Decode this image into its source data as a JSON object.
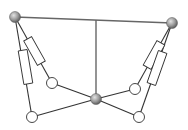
{
  "diagram": {
    "type": "parallel-mechanism-schematic",
    "colors": {
      "line": "#333333",
      "top_bar": "#666666",
      "ball_light": "#d8d8d8",
      "ball_dark": "#6e6e6e",
      "joint_fill": "#ffffff"
    },
    "nodes": [
      {
        "id": "base-left-ball",
        "kind": "spherical",
        "x": 15,
        "y": 17
      },
      {
        "id": "base-right-ball",
        "kind": "spherical",
        "x": 172,
        "y": 23
      },
      {
        "id": "platform-center-ball",
        "kind": "spherical",
        "x": 96,
        "y": 99
      },
      {
        "id": "left-inner-joint",
        "kind": "revolute",
        "x": 52,
        "y": 83
      },
      {
        "id": "left-outer-joint",
        "kind": "revolute",
        "x": 32,
        "y": 117
      },
      {
        "id": "right-inner-joint",
        "kind": "revolute",
        "x": 135,
        "y": 89
      },
      {
        "id": "right-outer-joint",
        "kind": "revolute",
        "x": 139,
        "y": 117
      }
    ],
    "actuators": [
      {
        "id": "left-outer-actuator",
        "from": "base-left-ball",
        "to": "left-outer-joint"
      },
      {
        "id": "left-inner-actuator",
        "from": "base-left-ball",
        "to": "left-inner-joint"
      },
      {
        "id": "right-inner-actuator",
        "from": "base-right-ball",
        "to": "right-inner-joint"
      },
      {
        "id": "right-outer-actuator",
        "from": "base-right-ball",
        "to": "right-outer-joint"
      }
    ],
    "links": [
      {
        "id": "top-bar",
        "from": "base-left-ball",
        "to": "base-right-ball"
      },
      {
        "id": "center-vertical",
        "from": "top-bar-mid",
        "to": "platform-center-ball"
      },
      {
        "id": "left-inner-link",
        "from": "left-inner-joint",
        "to": "platform-center-ball"
      },
      {
        "id": "left-outer-link",
        "from": "left-outer-joint",
        "to": "platform-center-ball"
      },
      {
        "id": "right-inner-link",
        "from": "right-inner-joint",
        "to": "platform-center-ball"
      },
      {
        "id": "right-outer-link",
        "from": "right-outer-joint",
        "to": "platform-center-ball"
      }
    ]
  }
}
